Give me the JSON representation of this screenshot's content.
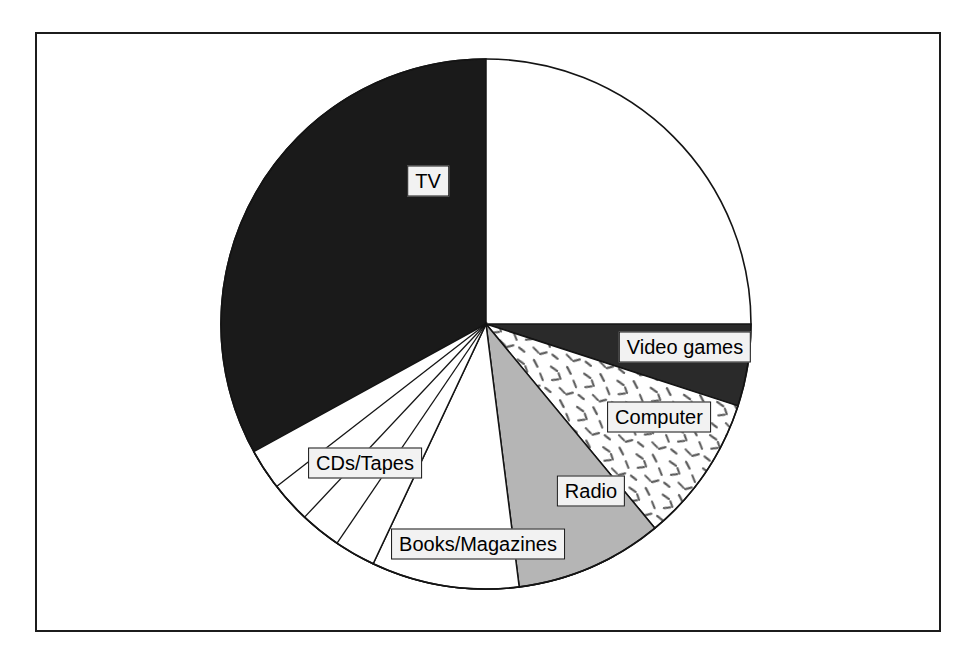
{
  "figure": {
    "kind": "pie-chart",
    "frame_border_color": "#1c1c1c",
    "background_color": "#ffffff"
  },
  "chart_data": {
    "type": "pie",
    "title": "",
    "subtitle": "",
    "xlabel": "",
    "ylabel": "",
    "legend_position": "none",
    "grid": false,
    "labels_on_slices": true,
    "center_px": [
      486,
      324
    ],
    "radius_px": 265,
    "start_angle_deg": -90,
    "direction": "counterclockwise",
    "categories": [
      "TV",
      "Video games",
      "Computer",
      "Radio",
      "Books/Magazines",
      "CDs/Tapes"
    ],
    "values": [
      58.0,
      5.0,
      9.0,
      9.0,
      9.0,
      10.0
    ],
    "units": "percent",
    "slices": [
      {
        "label": "TV",
        "value": 58.0,
        "fill": "#1a1a1a",
        "pattern": "solid-dark",
        "start_deg": 90.0,
        "end_deg": 298.8,
        "label_x": 428,
        "label_y": 181
      },
      {
        "label": "Video games",
        "value": 5.0,
        "fill": "#2a2a2a",
        "pattern": "solid-dark",
        "start_deg": 342.0,
        "end_deg": 360.0,
        "label_x": 685,
        "label_y": 347
      },
      {
        "label": "Computer",
        "value": 9.0,
        "fill": "#ffffff",
        "pattern": "speckle",
        "start_deg": 309.6,
        "end_deg": 342.0,
        "label_x": 659,
        "label_y": 417
      },
      {
        "label": "Radio",
        "value": 9.0,
        "fill": "#b5b5b5",
        "pattern": "solid-gray",
        "start_deg": 277.2,
        "end_deg": 309.6,
        "label_x": 591,
        "label_y": 491
      },
      {
        "label": "Books/Magazines",
        "value": 9.0,
        "fill": "#ffffff",
        "pattern": "solid-white",
        "start_deg": 244.8,
        "end_deg": 277.2,
        "label_x": 478,
        "label_y": 544
      },
      {
        "label": "CDs/Tapes",
        "value": 10.0,
        "fill": "#ffffff",
        "pattern": "solid-white-subdivided",
        "start_deg": 208.8,
        "end_deg": 244.8,
        "subdivisions": 4,
        "label_x": 365,
        "label_y": 463
      }
    ]
  },
  "labels": {
    "tv": "TV",
    "video_games": "Video games",
    "computer": "Computer",
    "radio": "Radio",
    "books_magazines": "Books/Magazines",
    "cds_tapes": "CDs/Tapes"
  },
  "colors": {
    "dark": "#1a1a1a",
    "gray": "#b5b5b5",
    "white": "#ffffff",
    "outline": "#141414",
    "label_box_fill": "#f2f2f2"
  }
}
